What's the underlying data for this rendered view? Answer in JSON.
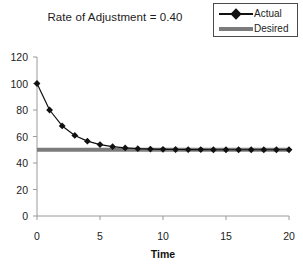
{
  "chart_data": {
    "type": "line",
    "title": "Rate of Adjustment = 0.40",
    "xlabel": "Time",
    "ylabel": "",
    "xlim": [
      0,
      20
    ],
    "ylim": [
      0,
      120
    ],
    "xticks": [
      0,
      5,
      10,
      15,
      20
    ],
    "yticks": [
      0,
      20,
      40,
      60,
      80,
      100,
      120
    ],
    "xtick_labels": [
      "0",
      "5",
      "10",
      "15",
      "20"
    ],
    "ytick_labels": [
      "0",
      "20",
      "40",
      "60",
      "80",
      "100",
      "120"
    ],
    "grid": false,
    "legend_position": "top-right",
    "x": [
      0,
      1,
      2,
      3,
      4,
      5,
      6,
      7,
      8,
      9,
      10,
      11,
      12,
      13,
      14,
      15,
      16,
      17,
      18,
      19,
      20
    ],
    "series": [
      {
        "name": "Actual",
        "marker": "diamond",
        "color": "#111111",
        "line_width": 1.2,
        "values": [
          100,
          80,
          68,
          60.8,
          56.5,
          53.9,
          52.3,
          51.4,
          50.8,
          50.5,
          50.3,
          50.2,
          50.1,
          50.1,
          50.0,
          50.0,
          50.0,
          50.0,
          50.0,
          50.0,
          50.0
        ]
      },
      {
        "name": "Desired",
        "marker": "none",
        "color": "#7b7b7b",
        "line_width": 4,
        "values": [
          50,
          50,
          50,
          50,
          50,
          50,
          50,
          50,
          50,
          50,
          50,
          50,
          50,
          50,
          50,
          50,
          50,
          50,
          50,
          50,
          50
        ]
      }
    ]
  },
  "legend": {
    "entries": [
      {
        "label": "Actual"
      },
      {
        "label": "Desired"
      }
    ]
  },
  "colors": {
    "actual": "#111111",
    "desired": "#7b7b7b",
    "axis": "#9a9a9a",
    "text": "#1c1c1c",
    "background": "#ffffff"
  }
}
